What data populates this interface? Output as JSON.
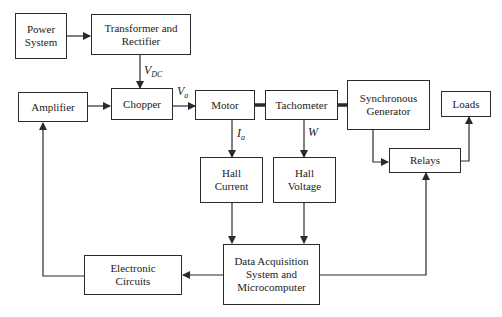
{
  "blocks": {
    "power_system": "Power\nSystem",
    "transformer": "Transformer and\nRectifier",
    "amplifier": "Amplifier",
    "chopper": "Chopper",
    "motor": "Motor",
    "tachometer": "Tachometer",
    "sync_generator": "Synchronous\nGenerator",
    "loads": "Loads",
    "hall_current": "Hall\nCurrent",
    "hall_voltage": "Hall\nVoltage",
    "relays": "Relays",
    "daq": "Data Acquisition\nSystem and\nMicrocomputer",
    "electronic_circuits": "Electronic\nCircuits"
  },
  "signals": {
    "vdc_main": "V",
    "vdc_sub": "DC",
    "va_main": "V",
    "va_sub": "a",
    "ia_main": "I",
    "ia_sub": "a",
    "w": "W"
  },
  "colors": {
    "line": "#2a2a2a",
    "background": "#ffffff"
  }
}
